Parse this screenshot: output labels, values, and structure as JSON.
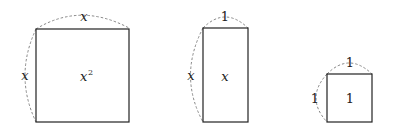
{
  "diagram": {
    "shapes": [
      {
        "name": "x-by-x square",
        "top_label": "x",
        "side_label": "x",
        "area_label": "x²",
        "area_base": "x",
        "area_exp": "2"
      },
      {
        "name": "1-by-x rectangle",
        "top_label": "1",
        "side_label": "x",
        "area_label": "x"
      },
      {
        "name": "1-by-1 square",
        "top_label": "1",
        "side_label": "1",
        "area_label": "1"
      }
    ],
    "colors": {
      "stroke": "#222222",
      "dashed": "#888888"
    }
  }
}
